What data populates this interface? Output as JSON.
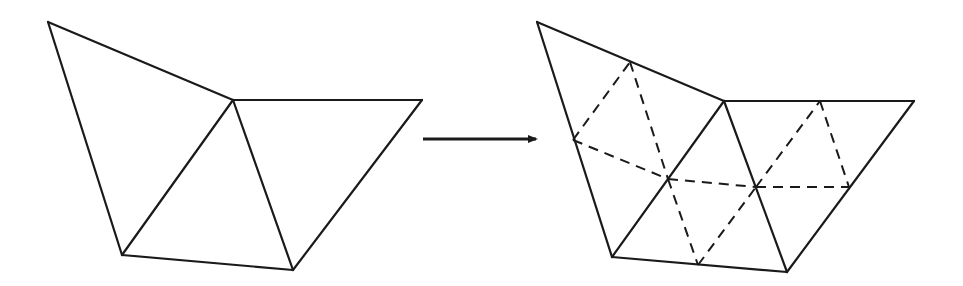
{
  "diagram": {
    "colors": {
      "stroke": "#1a1a1a",
      "background": "#ffffff"
    },
    "left_mesh": {
      "vertices": {
        "A": [
          48,
          22
        ],
        "B": [
          233,
          100
        ],
        "C": [
          422,
          100
        ],
        "D": [
          122,
          255
        ],
        "E": [
          293,
          270
        ]
      },
      "edges": [
        [
          "A",
          "B"
        ],
        [
          "B",
          "C"
        ],
        [
          "C",
          "E"
        ],
        [
          "E",
          "D"
        ],
        [
          "D",
          "A"
        ],
        [
          "D",
          "B"
        ],
        [
          "B",
          "E"
        ]
      ],
      "triangles": [
        [
          "A",
          "B",
          "D"
        ],
        [
          "B",
          "E",
          "D"
        ],
        [
          "B",
          "C",
          "E"
        ]
      ]
    },
    "arrow": {
      "from": [
        423,
        139
      ],
      "to": [
        536,
        139
      ],
      "label": ""
    },
    "right_mesh": {
      "vertices": {
        "A": [
          537,
          22
        ],
        "B": [
          724,
          101
        ],
        "C": [
          914,
          101
        ],
        "D": [
          612,
          257
        ],
        "E": [
          787,
          272
        ],
        "M_AB": [
          630,
          62
        ],
        "M_BC": [
          820,
          101
        ],
        "M_AD": [
          573,
          140
        ],
        "M_DE": [
          698,
          265
        ],
        "M_CE": [
          849,
          187
        ],
        "G1": [
          668,
          179
        ],
        "G2": [
          756,
          187
        ]
      },
      "solid_edges": [
        [
          "A",
          "B"
        ],
        [
          "B",
          "C"
        ],
        [
          "C",
          "E"
        ],
        [
          "E",
          "D"
        ],
        [
          "D",
          "A"
        ],
        [
          "D",
          "B"
        ],
        [
          "B",
          "E"
        ]
      ],
      "dashed_edges": [
        [
          "M_AD",
          "M_AB"
        ],
        [
          "M_AB",
          "G1"
        ],
        [
          "M_AD",
          "G1"
        ],
        [
          "G1",
          "M_DE"
        ],
        [
          "M_DE",
          "G2"
        ],
        [
          "G1",
          "G2"
        ],
        [
          "G2",
          "M_BC"
        ],
        [
          "M_BC",
          "M_CE"
        ],
        [
          "G2",
          "M_CE"
        ]
      ]
    }
  }
}
